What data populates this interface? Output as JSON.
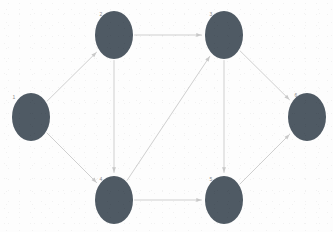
{
  "figure": {
    "type": "directed-graph",
    "width": 333,
    "height": 232,
    "background_color": "#fdfdfd",
    "node_fill_color": "#4f5a64",
    "edge_color": "#c9c9c9",
    "label_color": "#8a8a8a",
    "node_count": 6,
    "edge_count": 9
  },
  "graph_data": {
    "directed": true,
    "nodes": [
      {
        "id": "1",
        "label": "1",
        "cx": 31,
        "cy": 117,
        "rx": 19,
        "ry": 24,
        "label_x": 14,
        "label_y": 98
      },
      {
        "id": "2",
        "label": "2",
        "cx": 114,
        "cy": 35,
        "rx": 19,
        "ry": 24,
        "label_x": 101,
        "label_y": 15
      },
      {
        "id": "3",
        "label": "3",
        "cx": 224,
        "cy": 35,
        "rx": 19,
        "ry": 24,
        "label_x": 211,
        "label_y": 15
      },
      {
        "id": "4",
        "label": "4",
        "cx": 114,
        "cy": 200,
        "rx": 19,
        "ry": 24,
        "label_x": 101,
        "label_y": 180
      },
      {
        "id": "5",
        "label": "5",
        "cx": 224,
        "cy": 200,
        "rx": 19,
        "ry": 24,
        "label_x": 211,
        "label_y": 180
      },
      {
        "id": "6",
        "label": "6",
        "cx": 307,
        "cy": 117,
        "rx": 19,
        "ry": 24,
        "label_x": 296,
        "label_y": 96
      }
    ],
    "edges": [
      {
        "source": "1",
        "target": "2",
        "label": ""
      },
      {
        "source": "1",
        "target": "4",
        "label": ""
      },
      {
        "source": "2",
        "target": "3",
        "label": ""
      },
      {
        "source": "2",
        "target": "4",
        "label": ""
      },
      {
        "source": "4",
        "target": "3",
        "label": ""
      },
      {
        "source": "4",
        "target": "5",
        "label": ""
      },
      {
        "source": "3",
        "target": "5",
        "label": ""
      },
      {
        "source": "3",
        "target": "6",
        "label": ""
      },
      {
        "source": "5",
        "target": "6",
        "label": ""
      }
    ]
  }
}
